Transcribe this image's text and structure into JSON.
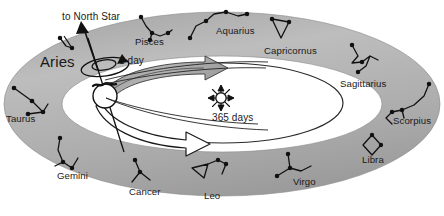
{
  "diagram": {
    "colors": {
      "band_fill": "#b3b3b3",
      "band_fill_light": "#cfcfcf",
      "band_fill_dark": "#9a9a9a",
      "stroke": "#1a1a1a",
      "background": "#ffffff",
      "arrow_band": "#a8a8a8"
    },
    "annotations": [
      {
        "id": "north-star",
        "text": "to North Star",
        "x": 62,
        "y": 17
      },
      {
        "id": "one-day",
        "text": "1 day",
        "x": 119,
        "y": 61
      },
      {
        "id": "year",
        "text": "365 days",
        "x": 212,
        "y": 118
      }
    ],
    "bodies": [
      {
        "id": "earth",
        "name": "Earth",
        "cx": 105,
        "cy": 96,
        "r": 12
      },
      {
        "id": "sun",
        "name": "Sun",
        "cx": 221,
        "cy": 98,
        "r": 6
      }
    ],
    "constellations": [
      {
        "name": "Aries",
        "x": 40,
        "y": 61,
        "size": "big"
      },
      {
        "name": "Pisces",
        "x": 135,
        "y": 42,
        "size": "zod"
      },
      {
        "name": "Aquarius",
        "x": 216,
        "y": 31,
        "size": "zod"
      },
      {
        "name": "Capricornus",
        "x": 264,
        "y": 51,
        "size": "zod"
      },
      {
        "name": "Sagittarius",
        "x": 340,
        "y": 84,
        "size": "zod"
      },
      {
        "name": "Scorpius",
        "x": 393,
        "y": 121,
        "size": "zod"
      },
      {
        "name": "Libra",
        "x": 362,
        "y": 160,
        "size": "zod"
      },
      {
        "name": "Virgo",
        "x": 293,
        "y": 182,
        "size": "zod"
      },
      {
        "name": "Leo",
        "x": 204,
        "y": 196,
        "size": "zod"
      },
      {
        "name": "Cancer",
        "x": 129,
        "y": 192,
        "size": "zod"
      },
      {
        "name": "Gemini",
        "x": 57,
        "y": 176,
        "size": "zod"
      },
      {
        "name": "Taurus",
        "x": 6,
        "y": 119,
        "size": "zod"
      }
    ]
  }
}
